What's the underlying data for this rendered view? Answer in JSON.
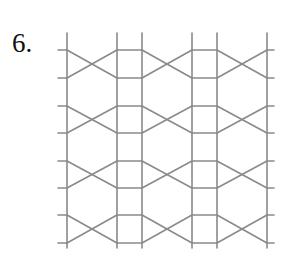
{
  "figure": {
    "label": "6.",
    "line_color": "#8a8a8a",
    "line_width": 1.6,
    "verticals_x": [
      67,
      117,
      142,
      192,
      217,
      267
    ],
    "vertical_top": 33,
    "vertical_bottom": 248,
    "stub_left": 58,
    "stub_right": 274,
    "bands": [
      [
        50,
        78
      ],
      [
        106,
        133
      ],
      [
        161,
        188
      ],
      [
        215,
        243
      ]
    ],
    "cross_spans": [
      [
        67,
        117
      ],
      [
        142,
        192
      ],
      [
        217,
        267
      ]
    ],
    "rung_spans": [
      [
        117,
        142
      ],
      [
        192,
        217
      ]
    ]
  }
}
